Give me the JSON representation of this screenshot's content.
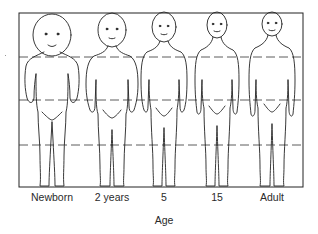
{
  "diagram": {
    "type": "body-proportions-by-age",
    "figures": [
      {
        "label": "Newborn",
        "center_x": 52,
        "head_ratio": 0.25
      },
      {
        "label": "2 years",
        "center_x": 112,
        "head_ratio": 0.2
      },
      {
        "label": "5",
        "center_x": 164,
        "head_ratio": 0.18
      },
      {
        "label": "15",
        "center_x": 217,
        "head_ratio": 0.15
      },
      {
        "label": "Adult",
        "center_x": 272,
        "head_ratio": 0.13
      }
    ],
    "axis_title": "Age",
    "reference_lines": "dashed horizontal lines dividing height into quarters",
    "colors": {
      "line": "#222222",
      "background": "#ffffff"
    }
  }
}
